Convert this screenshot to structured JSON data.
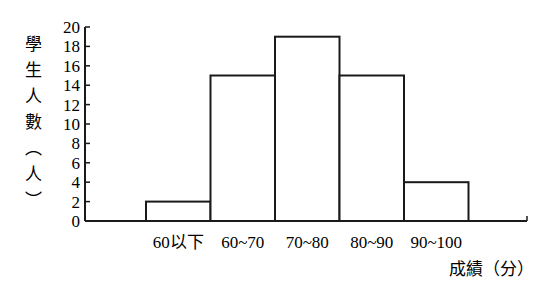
{
  "chart_data": {
    "type": "bar",
    "title": "",
    "xlabel": "成績（分）",
    "ylabel": "學生人數（人）",
    "ylabel_chars": [
      "學",
      "生",
      "人",
      "數",
      "︵",
      "人",
      "︶"
    ],
    "categories": [
      "60以下",
      "60~70",
      "70~80",
      "80~90",
      "90~100"
    ],
    "values": [
      2,
      15,
      19,
      15,
      4
    ],
    "yticks": [
      0,
      2,
      4,
      6,
      8,
      10,
      12,
      14,
      16,
      18,
      20
    ],
    "ylim": [
      0,
      20
    ],
    "grid": false,
    "legend": null,
    "bar_fill": "#ffffff",
    "bar_stroke": "#1a1a1a"
  }
}
